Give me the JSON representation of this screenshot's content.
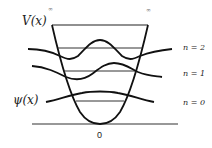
{
  "diagram": {
    "potential_label": "V(x)",
    "wavefunction_label": "ψ(x)",
    "infinity_left": "∞",
    "infinity_right": "∞",
    "origin_label": "0",
    "levels": [
      {
        "n": 2,
        "label": "n = 2"
      },
      {
        "n": 1,
        "label": "n = 1"
      },
      {
        "n": 0,
        "label": "n = 0"
      }
    ],
    "colors": {
      "stroke": "#1a1a1a",
      "level_line": "#333333",
      "text": "#222222",
      "background": "#ffffff"
    }
  }
}
